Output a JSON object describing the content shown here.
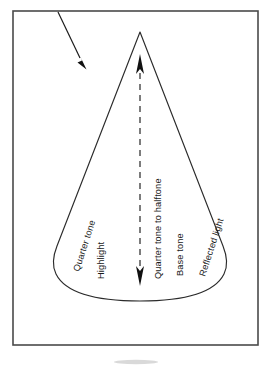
{
  "figure": {
    "background_color": "#ffffff",
    "frame_color": "#4a4a4a",
    "ink_color": "#1a1a1a",
    "frame": {
      "x": 13,
      "y": 11,
      "width": 245,
      "height": 334
    }
  },
  "light_source": {
    "name": "light-direction-arrow",
    "description": "Arrow indicating direction of incoming light",
    "from": {
      "x": 58,
      "y": 12
    },
    "to": {
      "x": 83,
      "y": 65
    }
  },
  "axis": {
    "name": "center-axis",
    "description": "Dashed vertical center axis with arrowheads at both ends",
    "x": 140,
    "top_y": 55,
    "bottom_y": 285,
    "dash_pattern": "6 5",
    "arrowheads": "both"
  },
  "cone": {
    "apex": {
      "x": 140,
      "y": 32
    },
    "base_left": {
      "x": 53,
      "y": 262
    },
    "base_right": {
      "x": 227,
      "y": 262
    },
    "base_bottom_y": 301
  },
  "labels": [
    {
      "id": "quarter-tone",
      "text": "Quarter tone",
      "x": 79,
      "y": 272,
      "rotation": -72
    },
    {
      "id": "highlight",
      "text": "Highlight",
      "x": 104,
      "y": 279,
      "rotation": -90
    },
    {
      "id": "quarter-tone-to-halftone",
      "text": "Quarter tone to halftone",
      "x": 161,
      "y": 279,
      "rotation": -90
    },
    {
      "id": "base-tone",
      "text": "Base tone",
      "x": 183,
      "y": 276,
      "rotation": -90
    },
    {
      "id": "reflected-light",
      "text": "Reflected light",
      "x": 205,
      "y": 277,
      "rotation": -72
    }
  ]
}
